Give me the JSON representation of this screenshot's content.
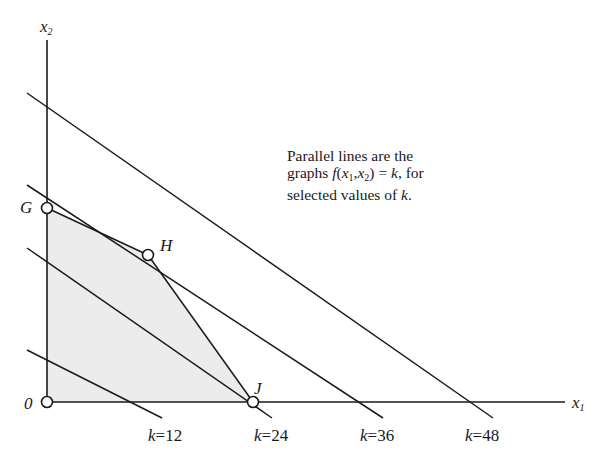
{
  "diagram": {
    "axes": {
      "x_label": "x",
      "x_sub": "1",
      "y_label": "x",
      "y_sub": "2",
      "origin_label": "0"
    },
    "points": [
      {
        "name": "O",
        "label": "0",
        "px": [
          47,
          402
        ]
      },
      {
        "name": "G",
        "label": "G",
        "px": [
          47,
          208
        ]
      },
      {
        "name": "H",
        "label": "H",
        "px": [
          148,
          255
        ]
      },
      {
        "name": "J",
        "label": "J",
        "px": [
          253,
          402
        ]
      }
    ],
    "feasible_region": [
      "O",
      "G",
      "H",
      "J"
    ],
    "level_lines": [
      {
        "k": 12,
        "label_k": "k",
        "label_eq": "=12"
      },
      {
        "k": 24,
        "label_k": "k",
        "label_eq": "=24"
      },
      {
        "k": 36,
        "label_k": "k",
        "label_eq": "=36"
      },
      {
        "k": 48,
        "label_k": "k",
        "label_eq": "=48"
      }
    ],
    "note": {
      "line1": "Parallel lines are the",
      "line2_a": "graphs ",
      "line2_f": "f",
      "line2_b": "(",
      "line2_x1": "x",
      "line2_x1sub": "1",
      "line2_comma": ",",
      "line2_x2": "x",
      "line2_x2sub": "2",
      "line2_c": ") = ",
      "line2_k": "k",
      "line2_d": ", for",
      "line3_a": "selected values of ",
      "line3_k": "k",
      "line3_b": "."
    },
    "colors": {
      "ink": "#1a1a1a",
      "region_fill": "#ececec",
      "background": "#ffffff"
    }
  }
}
